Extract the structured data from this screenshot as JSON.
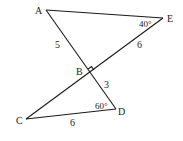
{
  "diagram": {
    "type": "geometry",
    "points": {
      "A": {
        "label": "A",
        "x": 46,
        "y": 10
      },
      "E": {
        "label": "E",
        "x": 163,
        "y": 18
      },
      "B": {
        "label": "B",
        "x": 90,
        "y": 72
      },
      "C": {
        "label": "C",
        "x": 26,
        "y": 119
      },
      "D": {
        "label": "D",
        "x": 116,
        "y": 109
      }
    },
    "segments": [
      {
        "from": "A",
        "to": "E"
      },
      {
        "from": "A",
        "to": "D"
      },
      {
        "from": "E",
        "to": "C"
      },
      {
        "from": "C",
        "to": "D"
      }
    ],
    "lengths": {
      "AB": "5",
      "BE": "6",
      "BD": "3",
      "CD": "6"
    },
    "angles": {
      "E": "40°",
      "D": "60°",
      "B_right_angle": true
    }
  }
}
